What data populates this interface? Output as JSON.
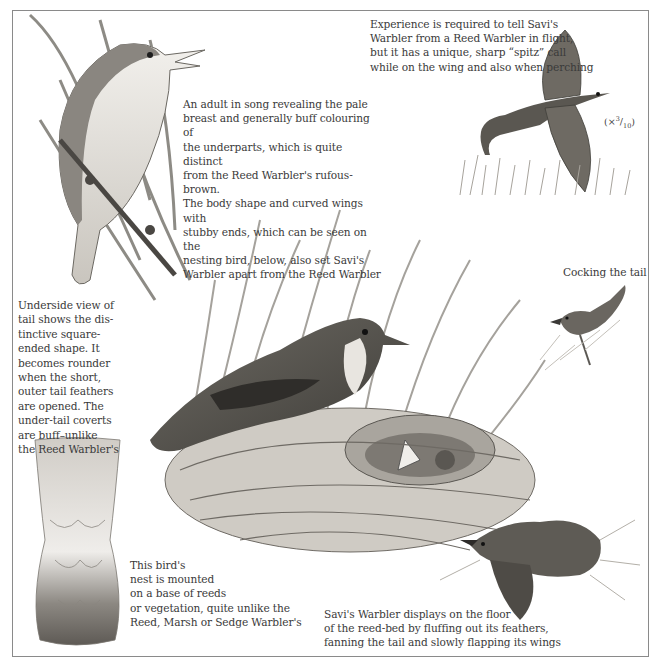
{
  "plate": {
    "frame_color": "#8a8a8a",
    "background": "#ffffff",
    "ink_color": "#3a3a3a"
  },
  "captions": {
    "flight": "Experience is required to tell Savi's\nWarbler from a Reed Warbler in flight,\nbut it has a unique, sharp “spitz” call\nwhile on the wing and also when perching",
    "adult": "An adult in song revealing the pale\nbreast and generally buff colouring of\nthe underparts, which is quite distinct\nfrom the Reed Warbler's rufous-brown.\nThe body shape and curved wings with\nstubby ends, which can be seen on the\nnesting bird, below, also set Savi's\nWarbler apart from the Reed Warbler",
    "tail": "Underside view of\ntail shows the dis-\ntinctive square-\nended shape. It\nbecomes rounder\nwhen the short,\nouter tail feathers\nare opened. The\nunder-tail coverts\nare buff–unlike\nthe Reed Warbler's",
    "nest": "This bird's\nnest is mounted\non a base of reeds\nor vegetation, quite unlike the\nReed, Marsh or Sedge Warbler's",
    "display": "Savi's Warbler displays on the floor\nof the reed-bed by fluffing out its feathers,\nfanning the tail and slowly flapping its wings",
    "cocking": "Cocking the tail"
  },
  "scale": {
    "prefix": "(×",
    "numerator": "3",
    "denominator": "10",
    "suffix": ")"
  },
  "illustrations": [
    {
      "id": "singing-adult",
      "subject": "Savi's Warbler adult in song perched on reed"
    },
    {
      "id": "flying-bird",
      "subject": "Savi's Warbler in flight over grass"
    },
    {
      "id": "cocking-bird",
      "subject": "Savi's Warbler cocking the tail"
    },
    {
      "id": "tail-underside",
      "subject": "Underside view of tail"
    },
    {
      "id": "nesting-bird",
      "subject": "Savi's Warbler at nest with chicks"
    },
    {
      "id": "display-bird",
      "subject": "Savi's Warbler displaying on reed-bed floor"
    }
  ]
}
